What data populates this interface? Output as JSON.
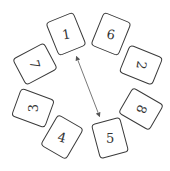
{
  "diagram": {
    "cards": [
      {
        "label": "1",
        "x": 66,
        "y": 34,
        "card_rot": -22,
        "text_rot": -10
      },
      {
        "label": "6",
        "x": 111,
        "y": 34,
        "card_rot": 22,
        "text_rot": 10
      },
      {
        "label": "2",
        "x": 141,
        "y": 65,
        "card_rot": -68,
        "text_rot": 100
      },
      {
        "label": "8",
        "x": 141,
        "y": 109,
        "card_rot": -60,
        "text_rot": 110
      },
      {
        "label": "5",
        "x": 110,
        "y": 138,
        "card_rot": -15,
        "text_rot": 0
      },
      {
        "label": "4",
        "x": 62,
        "y": 137,
        "card_rot": 30,
        "text_rot": 15
      },
      {
        "label": "3",
        "x": 33,
        "y": 108,
        "card_rot": -70,
        "text_rot": -90
      },
      {
        "label": "7",
        "x": 35,
        "y": 64,
        "card_rot": 62,
        "text_rot": 75
      }
    ],
    "arrow": {
      "from": [
        77,
        58
      ],
      "to": [
        99,
        115
      ],
      "type": "double-headed",
      "color": "#555555"
    }
  }
}
